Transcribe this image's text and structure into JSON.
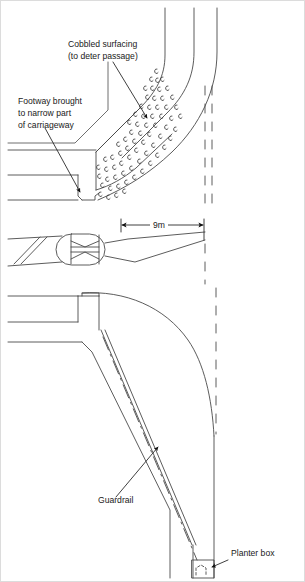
{
  "figure": {
    "background_color": "#ffffff",
    "line_color": "#444444",
    "text_color": "#1a1a1a",
    "border_color": "#d8d8d8"
  },
  "annotations": {
    "cobbled_surfacing": {
      "line1": "Cobbled surfacing",
      "line2": "(to deter passage)"
    },
    "footway": {
      "line1": "Footway brought",
      "line2": "to narrow part",
      "line3": "of carriageway"
    },
    "guardrail": {
      "label": "Guardrail"
    },
    "planter_box": {
      "label": "Planter box"
    }
  },
  "dimensions": {
    "carriageway_width": {
      "label": "9m",
      "value": 9,
      "unit": "m"
    }
  },
  "views": {
    "top": {
      "name": "plan-with-cobbled-corner"
    },
    "middle": {
      "name": "plan-with-central-island"
    },
    "bottom": {
      "name": "plan-with-guardrail-and-planter"
    }
  }
}
